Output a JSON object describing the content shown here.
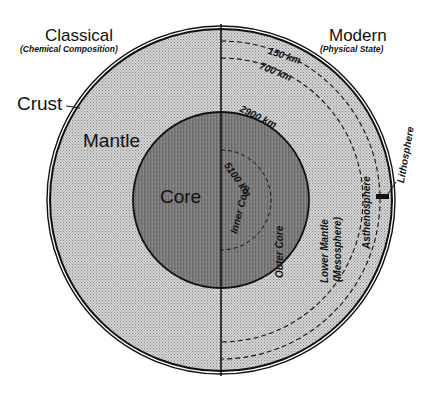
{
  "diagram": {
    "title_left": "Classical",
    "subtitle_left": "(Chemical Composition)",
    "title_right": "Modern",
    "subtitle_right": "(Physical State)",
    "classical_layers": [
      {
        "label": "Crust"
      },
      {
        "label": "Mantle"
      },
      {
        "label": "Core"
      }
    ],
    "modern_layers": [
      {
        "label": "Lithosphere"
      },
      {
        "label": "Asthenosphere"
      },
      {
        "label": "Lower Mantle",
        "sublabel": "(Mesosphere)"
      },
      {
        "label": "Outer Core"
      },
      {
        "label": "Inner Core"
      }
    ],
    "depth_markers": [
      {
        "label": "150 km"
      },
      {
        "label": "700 km"
      },
      {
        "label": "2900 km"
      },
      {
        "label": "5100 km"
      }
    ],
    "colors": {
      "mantle_fill": "#c8c8c8",
      "core_fill": "#7a7a7a",
      "line": "#111111",
      "background": "#ffffff"
    }
  }
}
